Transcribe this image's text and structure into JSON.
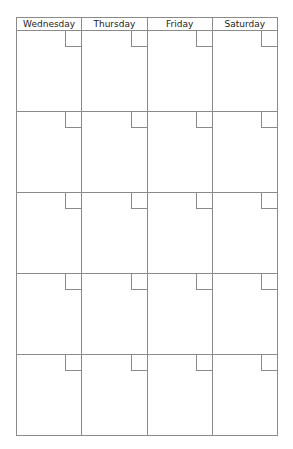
{
  "calendar": {
    "days": [
      "Wednesday",
      "Thursday",
      "Friday",
      "Saturday"
    ],
    "rows": 5
  }
}
